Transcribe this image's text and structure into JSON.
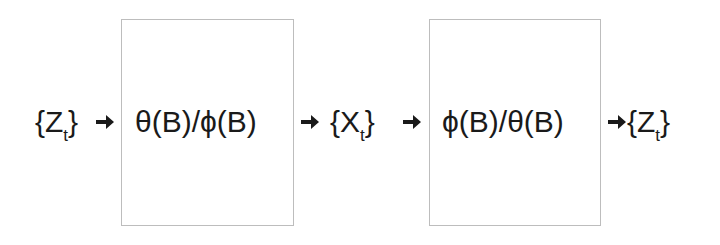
{
  "diagram": {
    "nodes": [
      {
        "id": "input",
        "base": "Z",
        "sub": "t"
      },
      {
        "id": "filter1",
        "text": "θ(B)/ϕ(B)"
      },
      {
        "id": "middle",
        "base": "X",
        "sub": "t"
      },
      {
        "id": "filter2",
        "text": "ϕ(B)/θ(B)"
      },
      {
        "id": "output",
        "base": "Z",
        "sub": "t"
      }
    ],
    "brace_open": "{",
    "brace_close": "}",
    "edges": [
      {
        "from": "input",
        "to": "filter1"
      },
      {
        "from": "filter1",
        "to": "middle"
      },
      {
        "from": "middle",
        "to": "filter2"
      },
      {
        "from": "filter2",
        "to": "output"
      }
    ],
    "colors": {
      "box_border": "#bdbdbd",
      "text": "#1a1a1a"
    }
  }
}
